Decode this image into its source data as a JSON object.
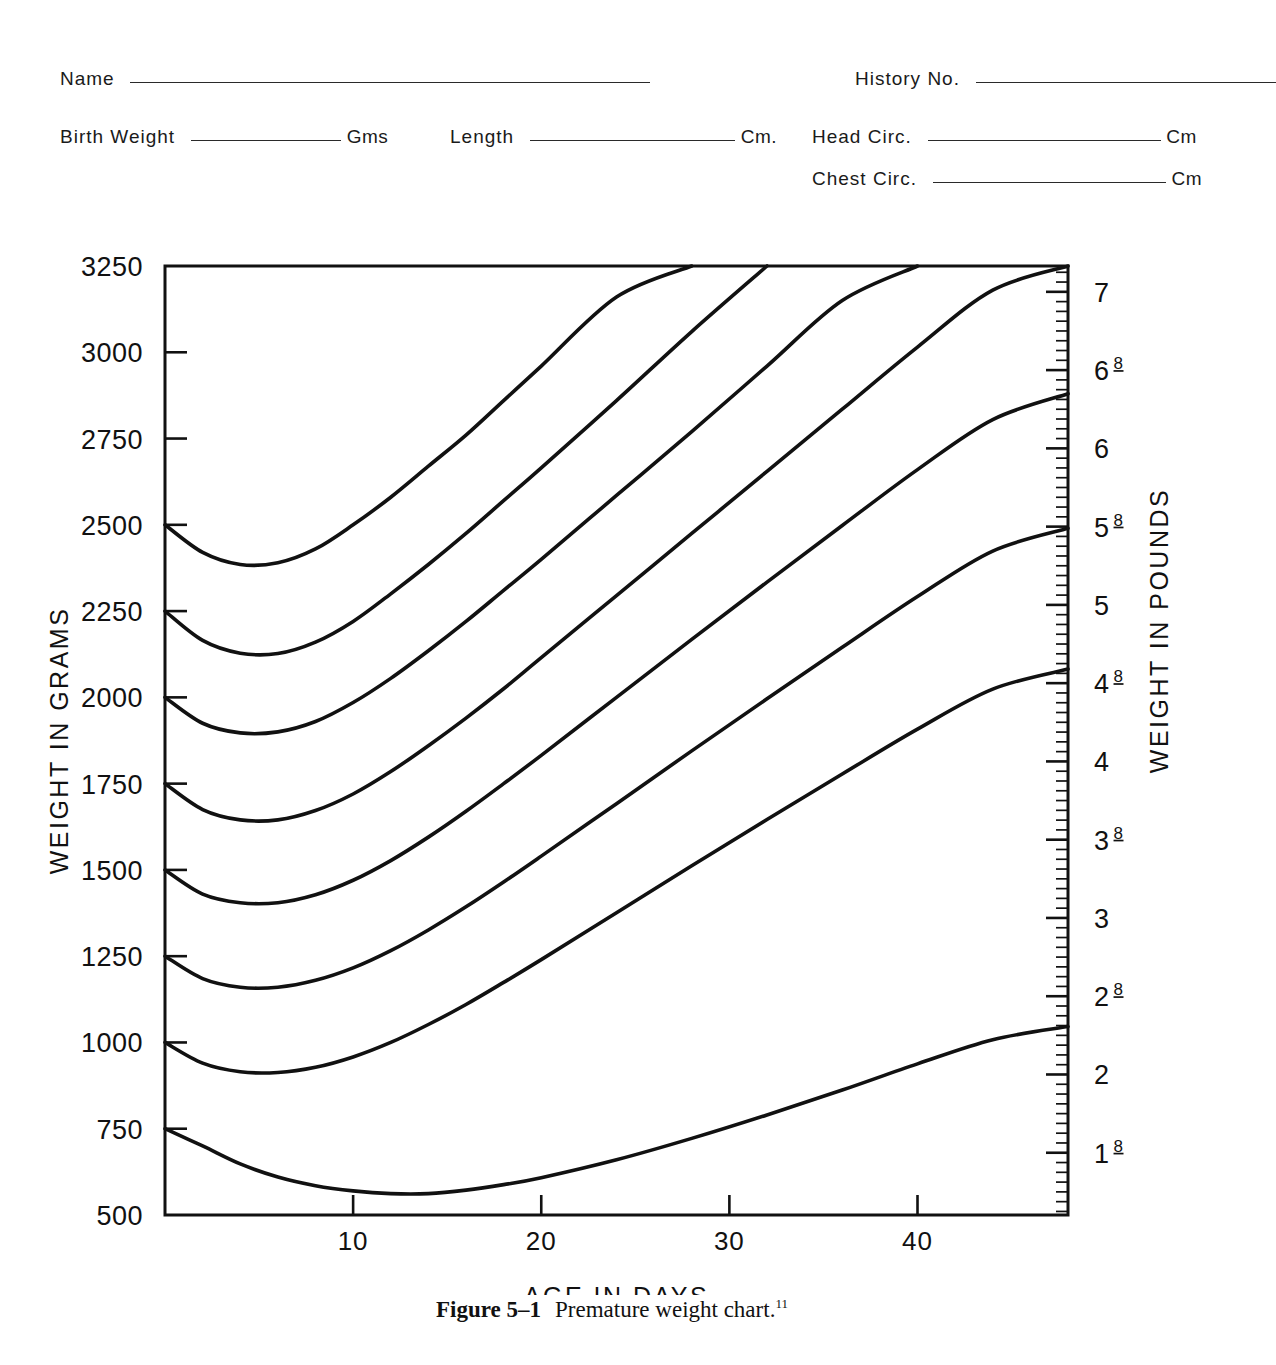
{
  "form": {
    "rows": [
      [
        {
          "label": "Name",
          "line_width": 520,
          "unit": ""
        },
        {
          "label": "History No.",
          "line_width": 310,
          "unit": ""
        }
      ],
      [
        {
          "label": "Birth Weight",
          "line_width": 150,
          "unit": "Gms"
        },
        {
          "label": "Length",
          "line_width": 205,
          "unit": "Cm."
        },
        {
          "label": "Head Circ.",
          "line_width": 235,
          "unit": "Cm"
        }
      ],
      [
        {
          "label": "Chest Circ.",
          "line_width": 235,
          "unit": "Cm"
        }
      ]
    ],
    "name_label": "Name",
    "history_label": "History No.",
    "birth_weight_label": "Birth Weight",
    "birth_weight_unit": "Gms",
    "length_label": "Length",
    "length_unit": "Cm.",
    "head_circ_label": "Head Circ.",
    "head_circ_unit": "Cm",
    "chest_circ_label": "Chest Circ.",
    "chest_circ_unit": "Cm"
  },
  "caption": {
    "figure_number": "Figure 5–1",
    "text": "Premature weight chart.",
    "reference": "11"
  },
  "chart_data": {
    "type": "line",
    "title": "Premature weight chart",
    "xlabel": "AGE IN DAYS",
    "ylabel": "WEIGHT IN GRAMS",
    "y2label": "WEIGHT IN POUNDS",
    "xlim": [
      0,
      48
    ],
    "ylim": [
      500,
      3250
    ],
    "grid": false,
    "legend": "none",
    "x_ticks": [
      10,
      20,
      30,
      40
    ],
    "x_tick_labels": [
      "10",
      "20",
      "30",
      "40"
    ],
    "y_ticks": [
      500,
      750,
      1000,
      1250,
      1500,
      1750,
      2000,
      2250,
      2500,
      2750,
      3000,
      3250
    ],
    "y_tick_labels": [
      "500",
      "750",
      "1000",
      "1250",
      "1500",
      "1750",
      "2000",
      "2250",
      "2500",
      "2750",
      "3000",
      "3250"
    ],
    "y2_ticks": [
      {
        "label": "1 Lb.",
        "whole": "1",
        "frac": "",
        "unit": "Lb.",
        "pounds": 1.0
      },
      {
        "label": "1 8/16",
        "whole": "1",
        "frac": "8",
        "unit": "",
        "pounds": 1.5
      },
      {
        "label": "2",
        "whole": "2",
        "frac": "",
        "unit": "",
        "pounds": 2.0
      },
      {
        "label": "2 8/16",
        "whole": "2",
        "frac": "8",
        "unit": "",
        "pounds": 2.5
      },
      {
        "label": "3",
        "whole": "3",
        "frac": "",
        "unit": "",
        "pounds": 3.0
      },
      {
        "label": "3 8/16",
        "whole": "3",
        "frac": "8",
        "unit": "",
        "pounds": 3.5
      },
      {
        "label": "4",
        "whole": "4",
        "frac": "",
        "unit": "",
        "pounds": 4.0
      },
      {
        "label": "4 8/16",
        "whole": "4",
        "frac": "8",
        "unit": "",
        "pounds": 4.5
      },
      {
        "label": "5",
        "whole": "5",
        "frac": "",
        "unit": "",
        "pounds": 5.0
      },
      {
        "label": "5 8/16",
        "whole": "5",
        "frac": "8",
        "unit": "",
        "pounds": 5.5
      },
      {
        "label": "6",
        "whole": "6",
        "frac": "",
        "unit": "",
        "pounds": 6.0
      },
      {
        "label": "6 8/16",
        "whole": "6",
        "frac": "8",
        "unit": "",
        "pounds": 6.5
      },
      {
        "label": "7",
        "whole": "7",
        "frac": "",
        "unit": "",
        "pounds": 7.0
      }
    ],
    "x": [
      0,
      2,
      4,
      6,
      8,
      10,
      12,
      14,
      16,
      18,
      20,
      24,
      28,
      32,
      36,
      40,
      44,
      48
    ],
    "series": [
      {
        "name": "2500 g birth weight",
        "birth_weight": 2500,
        "values": [
          2500,
          2420,
          2385,
          2390,
          2430,
          2500,
          2580,
          2670,
          2760,
          2860,
          2960,
          3160,
          3250,
          null,
          null,
          null,
          null,
          null
        ]
      },
      {
        "name": "2250 g birth weight",
        "birth_weight": 2250,
        "values": [
          2250,
          2165,
          2128,
          2127,
          2160,
          2220,
          2300,
          2385,
          2475,
          2570,
          2665,
          2860,
          3060,
          3250,
          null,
          null,
          null,
          null
        ]
      },
      {
        "name": "2000 g birth weight",
        "birth_weight": 2000,
        "values": [
          2000,
          1925,
          1897,
          1900,
          1930,
          1985,
          2055,
          2135,
          2220,
          2310,
          2400,
          2585,
          2770,
          2960,
          3150,
          3250,
          null,
          null
        ]
      },
      {
        "name": "1750 g birth weight",
        "birth_weight": 1750,
        "values": [
          1750,
          1675,
          1645,
          1645,
          1672,
          1720,
          1785,
          1860,
          1940,
          2025,
          2115,
          2295,
          2475,
          2655,
          2835,
          3015,
          3180,
          3250
        ]
      },
      {
        "name": "1500 g birth weight",
        "birth_weight": 1500,
        "values": [
          1500,
          1430,
          1405,
          1405,
          1428,
          1470,
          1527,
          1595,
          1670,
          1750,
          1832,
          2000,
          2168,
          2334,
          2498,
          2660,
          2805,
          2880
        ]
      },
      {
        "name": "1250 g birth weight",
        "birth_weight": 1250,
        "values": [
          1250,
          1185,
          1160,
          1160,
          1180,
          1216,
          1266,
          1326,
          1393,
          1465,
          1540,
          1692,
          1845,
          1996,
          2145,
          2292,
          2424,
          2490
        ]
      },
      {
        "name": "1000 g birth weight",
        "birth_weight": 1000,
        "values": [
          1000,
          940,
          915,
          913,
          928,
          958,
          1000,
          1052,
          1110,
          1174,
          1240,
          1376,
          1512,
          1646,
          1778,
          1908,
          2024,
          2082
        ]
      },
      {
        "name": "750 g birth weight",
        "birth_weight": 750,
        "values": [
          750,
          700,
          648,
          610,
          585,
          570,
          562,
          562,
          572,
          588,
          608,
          660,
          722,
          790,
          862,
          938,
          1008,
          1046
        ]
      }
    ]
  }
}
